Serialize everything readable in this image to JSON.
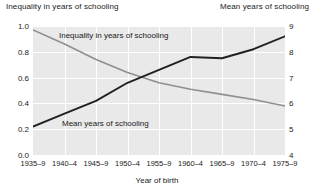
{
  "header": {
    "left_axis_title": "Inequality in years of schooling",
    "right_axis_title": "Mean years of schooling"
  },
  "axes": {
    "x_title": "Year of birth",
    "y_left_ticks": [
      "1.0",
      "0.8",
      "0.6",
      "0.4",
      "0.2",
      "0.0"
    ],
    "y_right_ticks": [
      "9",
      "8",
      "7",
      "6",
      "5",
      "4"
    ],
    "x_ticks": [
      "1935–9",
      "1940–4",
      "1945–9",
      "1950–4",
      "1955–9",
      "1960–4",
      "1965–9",
      "1970–4",
      "1975–9"
    ]
  },
  "series_labels": {
    "inequality": "Inequality in years of schooling",
    "mean": "Mean years of schooling"
  },
  "colors": {
    "plot_background": "#e9e9e9",
    "gridline": "#ffffff",
    "inequality_line": "#8f8f8f",
    "mean_line": "#231f20",
    "text": "#1a1a1a"
  },
  "chart_data": {
    "type": "line",
    "title": "",
    "xlabel": "Year of birth",
    "ylabel": "Inequality in years of schooling",
    "y2label": "Mean years of schooling",
    "categories": [
      "1935–9",
      "1940–4",
      "1945–9",
      "1950–4",
      "1955–9",
      "1960–4",
      "1965–9",
      "1970–4",
      "1975–9"
    ],
    "ylim": [
      0.0,
      1.0
    ],
    "y2lim": [
      4,
      9
    ],
    "yticks": [
      0.0,
      0.2,
      0.4,
      0.6,
      0.8,
      1.0
    ],
    "y2ticks": [
      4,
      5,
      6,
      7,
      8,
      9
    ],
    "grid": true,
    "legend": "inline-annotations",
    "series": [
      {
        "name": "Inequality in years of schooling",
        "axis": "left",
        "color": "#8f8f8f",
        "values": [
          0.97,
          0.86,
          0.74,
          0.64,
          0.56,
          0.51,
          0.47,
          0.43,
          0.38
        ]
      },
      {
        "name": "Mean years of schooling",
        "axis": "right",
        "color": "#231f20",
        "values": [
          5.1,
          5.6,
          6.1,
          6.8,
          7.3,
          7.8,
          7.75,
          8.1,
          8.6
        ]
      }
    ]
  }
}
